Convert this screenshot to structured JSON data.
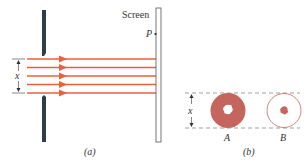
{
  "figure": {
    "panel_a": {
      "caption": "(a)",
      "screen_label": "Screen",
      "point_label": "P",
      "dimension_label": "x",
      "ray_count": 5
    },
    "panel_b": {
      "caption": "(b)",
      "dimension_label": "x",
      "disk_a_label": "A",
      "disk_b_label": "B"
    },
    "colors": {
      "ray": "#e8603c",
      "wall": "#2e3d48",
      "disk": "#c4665e",
      "screen_edge": "#555555",
      "dashed": "#777777"
    }
  }
}
